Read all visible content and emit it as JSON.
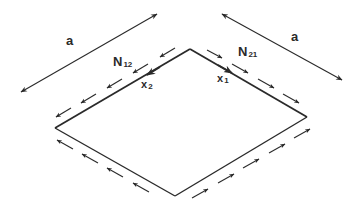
{
  "diagram": {
    "colors": {
      "stroke": "#2a2a2a",
      "background": "#ffffff"
    },
    "plate": {
      "vertices": {
        "top": [
          190,
          49
        ],
        "right": [
          307,
          117
        ],
        "bottom": [
          175,
          196
        ],
        "left": [
          55,
          128
        ]
      }
    },
    "dimensions": [
      {
        "label": "a",
        "from": [
          21,
          92
        ],
        "to": [
          157,
          14
        ],
        "label_pos": [
          66,
          34
        ]
      },
      {
        "label": "a",
        "from": [
          222,
          14
        ],
        "to": [
          342,
          80
        ],
        "label_pos": [
          290,
          30
        ]
      }
    ],
    "labels": {
      "n12": {
        "main": "N",
        "sub": "12"
      },
      "n21": {
        "main": "N",
        "sub": "21"
      },
      "x2": {
        "main": "x",
        "sub": "2"
      },
      "x1": {
        "main": "x",
        "sub": "1"
      },
      "a_left": "a",
      "a_right": "a"
    },
    "force_arrows": {
      "top_left_edge": "pointing down-left (toward left vertex)",
      "top_right_edge": "pointing down-right (toward right vertex)",
      "bottom_left_edge": "pointing up-left (toward left vertex)",
      "bottom_right_edge": "pointing up-right (toward right vertex)"
    },
    "axis_arrows": {
      "x2": "along top-left edge, from top vertex toward lower-left",
      "x1": "along top-right edge, from top vertex toward lower-right"
    }
  }
}
